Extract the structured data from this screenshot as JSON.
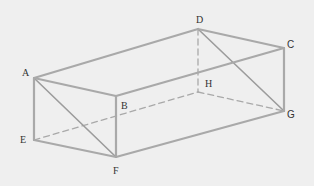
{
  "diagram": {
    "type": "rectangular-prism",
    "vertices": [
      "A",
      "B",
      "C",
      "D",
      "E",
      "F",
      "G",
      "H"
    ],
    "labels": {
      "A": "A",
      "B": "B",
      "C": "C",
      "D": "D",
      "E": "E",
      "F": "F",
      "G": "G",
      "H": "H"
    },
    "visible_edges": [
      [
        "A",
        "D"
      ],
      [
        "D",
        "C"
      ],
      [
        "C",
        "B"
      ],
      [
        "B",
        "A"
      ],
      [
        "A",
        "E"
      ],
      [
        "B",
        "F"
      ],
      [
        "C",
        "G"
      ],
      [
        "E",
        "F"
      ],
      [
        "F",
        "G"
      ]
    ],
    "hidden_edges": [
      [
        "D",
        "H"
      ],
      [
        "E",
        "H"
      ],
      [
        "H",
        "G"
      ]
    ],
    "diagonals": [
      [
        "A",
        "F"
      ],
      [
        "D",
        "G"
      ]
    ],
    "colors": {
      "background": "#efefef",
      "edge": "#a9a9a9",
      "label": "#333333"
    }
  }
}
